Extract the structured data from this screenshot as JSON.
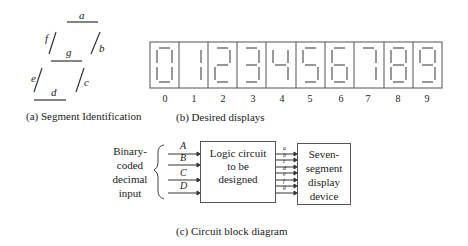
{
  "segment_id": {
    "segments": [
      "a",
      "b",
      "c",
      "d",
      "e",
      "f",
      "g"
    ],
    "caption": "(a) Segment Identification"
  },
  "displays": {
    "digits": [
      "0",
      "1",
      "2",
      "3",
      "4",
      "5",
      "6",
      "7",
      "8",
      "9"
    ],
    "caption": "(b) Desired displays"
  },
  "block_diagram": {
    "input_label": [
      "Binary-",
      "coded",
      "decimal",
      "input"
    ],
    "inputs": [
      "A",
      "B",
      "C",
      "D"
    ],
    "logic_box": [
      "Logic circuit",
      "to be",
      "designed"
    ],
    "outputs": [
      "a",
      "b",
      "c",
      "d",
      "e",
      "f",
      "g"
    ],
    "display_box": [
      "Seven-",
      "segment",
      "display",
      "device"
    ],
    "caption": "(c) Circuit block diagram"
  }
}
